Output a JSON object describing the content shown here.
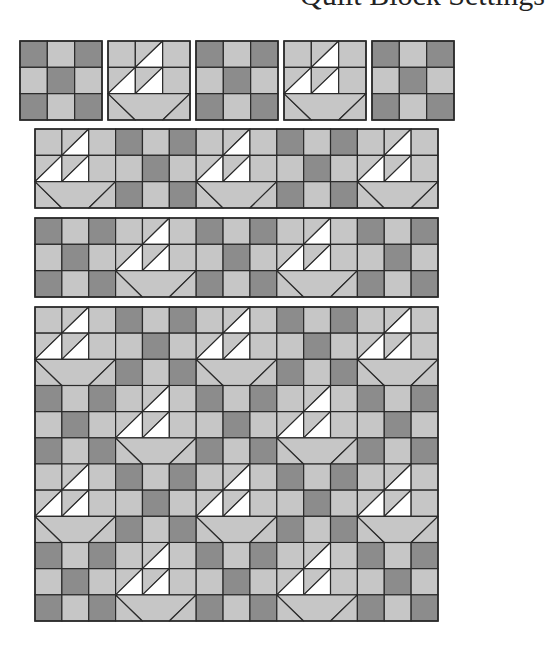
{
  "title_fragment": "Quilt Block Settings",
  "colors": {
    "dark": "#8c8c8c",
    "light": "#c6c6c6",
    "white": "#ffffff",
    "line": "#2a2a2a"
  },
  "block_types": {
    "nine_patch": {
      "name": "Nine-patch block",
      "grid": [
        [
          "dark",
          "light",
          "dark"
        ],
        [
          "light",
          "dark",
          "light"
        ],
        [
          "dark",
          "light",
          "dark"
        ]
      ]
    },
    "sailboat": {
      "name": "Sailboat block",
      "description": "Two half-square white sail triangles stacked above a light trapezoid hull"
    }
  },
  "sections": [
    {
      "name": "individual-blocks-row",
      "x": 20,
      "y": 41,
      "block_w": 82,
      "block_h": 79,
      "gap": 6,
      "joined": false,
      "rows": [
        [
          "nine_patch",
          "sailboat",
          "nine_patch",
          "sailboat",
          "nine_patch"
        ]
      ]
    },
    {
      "name": "row-strip-a",
      "x": 35,
      "y": 129,
      "block_w": 80.6,
      "block_h": 79,
      "gap": 0,
      "joined": true,
      "rows": [
        [
          "sailboat",
          "nine_patch",
          "sailboat",
          "nine_patch",
          "sailboat"
        ]
      ]
    },
    {
      "name": "row-strip-b",
      "x": 35,
      "y": 218,
      "block_w": 80.6,
      "block_h": 79,
      "gap": 0,
      "joined": true,
      "rows": [
        [
          "nine_patch",
          "sailboat",
          "nine_patch",
          "sailboat",
          "nine_patch"
        ]
      ]
    },
    {
      "name": "assembled-quilt",
      "x": 35,
      "y": 307,
      "block_w": 80.6,
      "block_h": 78.5,
      "gap": 0,
      "joined": true,
      "rows": [
        [
          "sailboat",
          "nine_patch",
          "sailboat",
          "nine_patch",
          "sailboat"
        ],
        [
          "nine_patch",
          "sailboat",
          "nine_patch",
          "sailboat",
          "nine_patch"
        ],
        [
          "sailboat",
          "nine_patch",
          "sailboat",
          "nine_patch",
          "sailboat"
        ],
        [
          "nine_patch",
          "sailboat",
          "nine_patch",
          "sailboat",
          "nine_patch"
        ]
      ]
    }
  ]
}
